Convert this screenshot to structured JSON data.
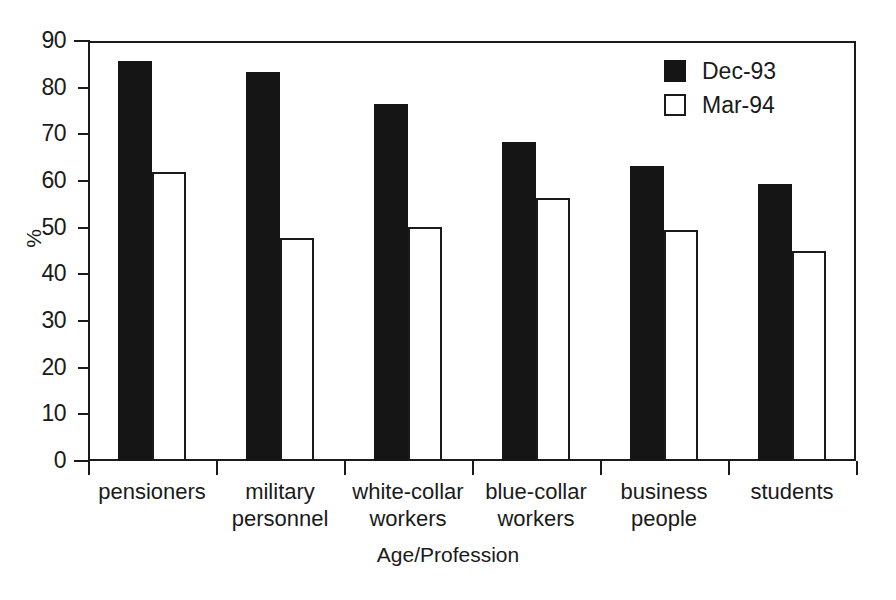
{
  "chart_data": {
    "type": "bar",
    "title": "",
    "xlabel": "Age/Profession",
    "ylabel": "%",
    "ylim": [
      0,
      90
    ],
    "ytick_step": 10,
    "yticks": [
      90,
      80,
      70,
      60,
      50,
      40,
      30,
      20,
      10,
      0
    ],
    "grid": false,
    "legend_position": "top-right",
    "categories": [
      "pensioners",
      "military\npersonnel",
      "white-collar\nworkers",
      "blue-collar\nworkers",
      "business\npeople",
      "students"
    ],
    "series": [
      {
        "name": "Dec-93",
        "color": "#151515",
        "style": "filled",
        "values": [
          85.8,
          83.4,
          76.6,
          68.4,
          63.2,
          59.3
        ]
      },
      {
        "name": "Mar-94",
        "color": "#ffffff",
        "style": "outlined",
        "values": [
          62.0,
          47.7,
          50.2,
          56.3,
          49.5,
          45.1
        ]
      }
    ]
  },
  "legend": {
    "items": [
      {
        "label": "Dec-93",
        "swatch": "filled-black-square"
      },
      {
        "label": "Mar-94",
        "swatch": "outlined-white-square"
      }
    ]
  },
  "axes": {
    "y_title": "%",
    "x_title": "Age/Profession",
    "y_tick_labels": [
      "90",
      "80",
      "70",
      "60",
      "50",
      "40",
      "30",
      "20",
      "10",
      "0"
    ],
    "x_tick_labels": [
      "pensioners",
      "military\npersonnel",
      "white-collar\nworkers",
      "blue-collar\nworkers",
      "business\npeople",
      "students"
    ]
  },
  "colors": {
    "axis": "#1a1a1a",
    "series_dec93": "#151515",
    "series_mar94": "#ffffff",
    "background": "#ffffff"
  }
}
